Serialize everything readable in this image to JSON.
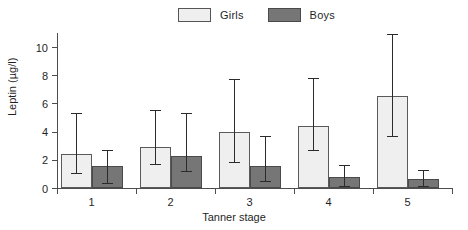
{
  "chart_data": {
    "type": "bar",
    "title": "",
    "xlabel": "Tanner stage",
    "ylabel": "Leptin (µg/l)",
    "categories": [
      "1",
      "2",
      "3",
      "4",
      "5"
    ],
    "ylim": [
      0,
      11
    ],
    "yticks": [
      0,
      2,
      4,
      6,
      8,
      10
    ],
    "ytick_labels": [
      "0",
      "2",
      "4",
      "6",
      "8",
      "10"
    ],
    "grid": false,
    "legend_position": "top-center",
    "series": [
      {
        "name": "Girls",
        "color": "#efefef",
        "values": [
          2.4,
          2.9,
          4.0,
          4.4,
          6.5
        ],
        "err_low": [
          1.05,
          1.7,
          1.85,
          2.7,
          3.7
        ],
        "err_high": [
          5.35,
          5.55,
          7.75,
          7.8,
          10.9
        ]
      },
      {
        "name": "Boys",
        "color": "#767676",
        "values": [
          1.55,
          2.3,
          1.55,
          0.8,
          0.65
        ],
        "err_low": [
          0.35,
          1.2,
          0.5,
          0.15,
          0.15
        ],
        "err_high": [
          2.7,
          5.3,
          3.7,
          1.6,
          1.25
        ]
      }
    ]
  },
  "legend": {
    "entries": [
      {
        "label": "Girls",
        "swatch": "girls-swatch"
      },
      {
        "label": "Boys",
        "swatch": "boys-swatch"
      }
    ]
  },
  "axes": {
    "y_axis_label": "Leptin (µg/l)",
    "x_axis_label": "Tanner stage"
  }
}
